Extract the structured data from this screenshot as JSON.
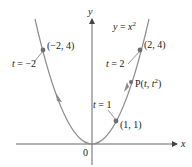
{
  "diagram": {
    "curve_label": "y = x²",
    "curve_label_parts": {
      "lhs": "y",
      "eq": " = ",
      "var": "x",
      "exp": "2"
    },
    "axes": {
      "x_label": "x",
      "y_label": "y",
      "origin_label": "0"
    },
    "points": [
      {
        "label": "(−2, 4)",
        "x": -2,
        "y": 4
      },
      {
        "label": "(2, 4)",
        "x": 2,
        "y": 4
      },
      {
        "label": "(1, 1)",
        "x": 1,
        "y": 1
      }
    ],
    "general_point": {
      "label_prefix": "P(",
      "t": "t",
      "sep": ", ",
      "t2": "t",
      "exp": "2",
      "suffix": ")"
    },
    "parameter_labels": [
      {
        "var": "t",
        "value": " = −2"
      },
      {
        "var": "t",
        "value": " = 2"
      },
      {
        "var": "t",
        "value": " = 1"
      }
    ],
    "colors": {
      "curve": "#8a8a8a",
      "axis": "#555555",
      "point": "#6f6f6f",
      "text": "#222222"
    }
  }
}
